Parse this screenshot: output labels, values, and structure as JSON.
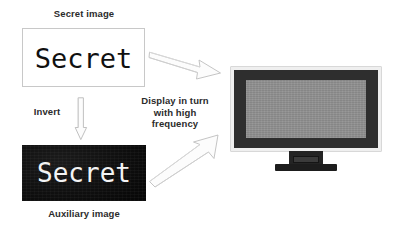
{
  "figure": {
    "background_color": "#ffffff"
  },
  "labels": {
    "secret_image": "Secret image",
    "auxiliary_image": "Auxiliary image",
    "invert": "Invert",
    "display": "Display in turn with high frequency"
  },
  "secret_image": {
    "text": "Secret",
    "background_color": "#ffffff",
    "text_color": "#101010",
    "border_color": "#c8c8c8"
  },
  "auxiliary_image": {
    "text": "Secret",
    "background_color": "#0b0b0b",
    "text_color": "#f4f4f4"
  },
  "arrows": {
    "invert_arrow": "arrow-down",
    "top_arrow": "arrow-right-down",
    "bottom_arrow": "arrow-right-up",
    "outline_color": "#b4b4b4",
    "fill_color": "#fbfbfb"
  },
  "monitor": {
    "frame_color": "#efefef",
    "bezel_color": "#2e2e2e",
    "screen_color": "#8f8f8f",
    "stand_color": "#1d1d1d"
  }
}
